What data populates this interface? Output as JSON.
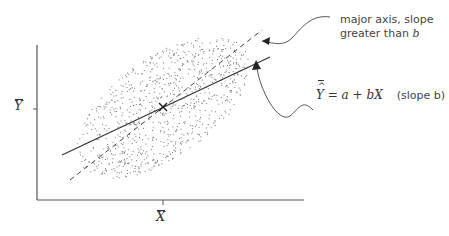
{
  "diagram": {
    "type": "scatter-with-regression",
    "axis_labels": {
      "y_mean": "Y",
      "x_mean": "X"
    },
    "annotations": {
      "major_axis": {
        "line1": "major axis, slope",
        "line2": "greater than ",
        "var": "b"
      },
      "regression": {
        "y": "Y",
        "equation": " = a + bX",
        "note": "(slope b)"
      }
    },
    "lines": [
      {
        "name": "regression line",
        "style": "solid"
      },
      {
        "name": "major axis",
        "style": "dashed"
      }
    ],
    "centroid_marker": "×",
    "colors": {
      "axis": "#555555",
      "points": "#666666",
      "text": "#333333"
    }
  }
}
